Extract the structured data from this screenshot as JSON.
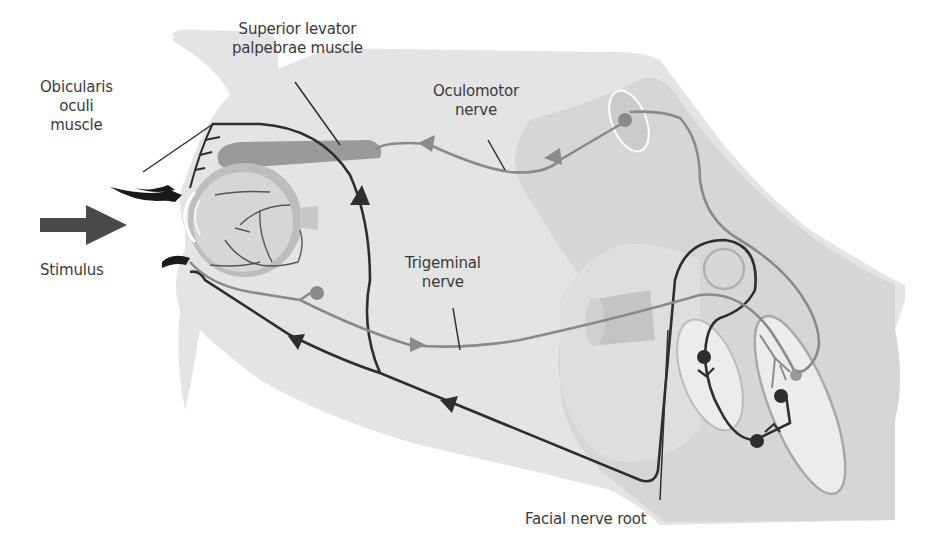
{
  "diagram": {
    "labels": {
      "superior_levator": [
        "Superior levator",
        "palpebrae muscle"
      ],
      "obicularis": [
        "Obicularis",
        "oculi",
        "muscle"
      ],
      "oculomotor": [
        "Oculomotor",
        "nerve"
      ],
      "stimulus": "Stimulus",
      "trigeminal": [
        "Trigeminal",
        "nerve"
      ],
      "facial_root": "Facial nerve root"
    },
    "colors": {
      "background": "#ffffff",
      "head_tissue": "#e4e4e4",
      "brainstem": "#d2d2d2",
      "deep_region": "#dadada",
      "nucleus_light": "#ececec",
      "muscle": "#9a9a9a",
      "eye": "#c8c8c8",
      "afferent_nerve": "#8a8a8a",
      "efferent_nerve": "#2e2e2e",
      "stimulus_arrow": "#4a4a4a",
      "text": "#3a3a3a"
    },
    "pathways": [
      {
        "name": "Oculomotor nerve",
        "type": "efferent",
        "direction": "brainstem to superior levator palpebrae"
      },
      {
        "name": "Trigeminal nerve",
        "type": "afferent",
        "direction": "cornea to brainstem"
      },
      {
        "name": "Facial nerve",
        "type": "efferent",
        "direction": "brainstem to obicularis oculi"
      }
    ]
  }
}
